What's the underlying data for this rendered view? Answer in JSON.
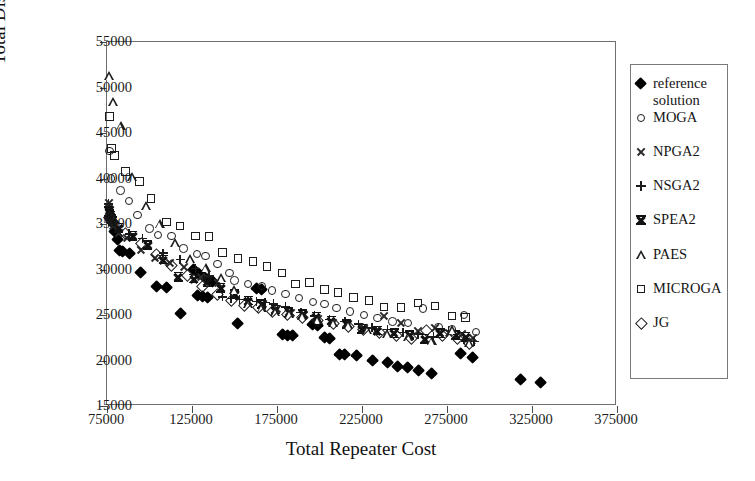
{
  "chart_data": {
    "type": "scatter",
    "title": "",
    "xlabel": "Total Repeater Cost",
    "ylabel": "Total Distance Cost",
    "xlim": [
      75000,
      375000
    ],
    "ylim": [
      15000,
      55000
    ],
    "xticks": [
      75000,
      125000,
      175000,
      225000,
      275000,
      325000,
      375000
    ],
    "yticks": [
      15000,
      20000,
      25000,
      30000,
      35000,
      40000,
      45000,
      50000,
      55000
    ],
    "xtick_labels": [
      "75000",
      "125000",
      "175000",
      "225000",
      "275000",
      "325000",
      "375000"
    ],
    "ytick_labels": [
      "15000",
      "20000",
      "25000",
      "30000",
      "35000",
      "40000",
      "45000",
      "50000",
      "55000"
    ],
    "grid": false,
    "legend_position": "right-outside",
    "series": [
      {
        "name": "reference solution",
        "marker": "filled-diamond",
        "color": "#000000",
        "points": [
          [
            76500,
            35700
          ],
          [
            77000,
            35500
          ],
          [
            77500,
            35300
          ],
          [
            78000,
            35100
          ],
          [
            79500,
            34200
          ],
          [
            81000,
            33300
          ],
          [
            82500,
            32100
          ],
          [
            84000,
            32000
          ],
          [
            88000,
            31700
          ],
          [
            95000,
            29700
          ],
          [
            104000,
            28100
          ],
          [
            110000,
            28000
          ],
          [
            118000,
            25200
          ],
          [
            126000,
            30000
          ],
          [
            129000,
            29500
          ],
          [
            131000,
            29300
          ],
          [
            134000,
            28900
          ],
          [
            137000,
            28700
          ],
          [
            128000,
            27100
          ],
          [
            131000,
            27000
          ],
          [
            134000,
            26900
          ],
          [
            152000,
            24100
          ],
          [
            163000,
            27900
          ],
          [
            166000,
            27800
          ],
          [
            178000,
            22800
          ],
          [
            181000,
            22700
          ],
          [
            184000,
            22700
          ],
          [
            196000,
            23900
          ],
          [
            199000,
            23800
          ],
          [
            203000,
            22500
          ],
          [
            206000,
            22400
          ],
          [
            212000,
            20700
          ],
          [
            215000,
            20600
          ],
          [
            222000,
            20500
          ],
          [
            231000,
            20000
          ],
          [
            240000,
            19800
          ],
          [
            246000,
            19300
          ],
          [
            252000,
            19200
          ],
          [
            258000,
            18900
          ],
          [
            266000,
            18600
          ],
          [
            283000,
            20800
          ],
          [
            290000,
            20300
          ],
          [
            318000,
            17900
          ],
          [
            330000,
            17600
          ]
        ]
      },
      {
        "name": "MOGA",
        "marker": "open-circle",
        "color": "#1c1c1c",
        "points": [
          [
            76500,
            43000
          ],
          [
            77500,
            40000
          ],
          [
            83000,
            38700
          ],
          [
            88000,
            37500
          ],
          [
            93000,
            36000
          ],
          [
            100000,
            34500
          ],
          [
            105000,
            33800
          ],
          [
            113000,
            33700
          ],
          [
            120000,
            32300
          ],
          [
            128000,
            31700
          ],
          [
            133000,
            31500
          ],
          [
            140000,
            30600
          ],
          [
            147000,
            29600
          ],
          [
            150000,
            28800
          ],
          [
            158000,
            28400
          ],
          [
            166000,
            28200
          ],
          [
            172000,
            27700
          ],
          [
            180000,
            27300
          ],
          [
            188000,
            26900
          ],
          [
            196000,
            26400
          ],
          [
            203000,
            26200
          ],
          [
            210000,
            25800
          ],
          [
            218000,
            25400
          ],
          [
            226000,
            25000
          ],
          [
            234000,
            24700
          ],
          [
            243000,
            24300
          ],
          [
            252000,
            24100
          ],
          [
            261000,
            25700
          ],
          [
            270000,
            23700
          ],
          [
            278000,
            23400
          ],
          [
            285000,
            25000
          ],
          [
            292000,
            23100
          ]
        ]
      },
      {
        "name": "NPGA2",
        "marker": "x",
        "color": "#2a2a2a",
        "points": [
          [
            76000,
            37300
          ],
          [
            76500,
            36600
          ],
          [
            77000,
            36000
          ],
          [
            77500,
            35600
          ],
          [
            78500,
            34800
          ],
          [
            82000,
            34000
          ],
          [
            87000,
            33500
          ],
          [
            95000,
            32200
          ],
          [
            103000,
            31300
          ],
          [
            112000,
            30700
          ],
          [
            120000,
            30300
          ],
          [
            130000,
            29200
          ],
          [
            140000,
            28500
          ],
          [
            150000,
            27200
          ],
          [
            158000,
            26500
          ],
          [
            167000,
            26200
          ],
          [
            175000,
            25700
          ],
          [
            183000,
            25200
          ],
          [
            191000,
            25000
          ],
          [
            199000,
            24600
          ],
          [
            208000,
            24200
          ],
          [
            217000,
            24000
          ],
          [
            226000,
            23600
          ],
          [
            238000,
            24900
          ],
          [
            248000,
            24200
          ],
          [
            258000,
            23300
          ],
          [
            268000,
            23600
          ],
          [
            276000,
            23100
          ],
          [
            284000,
            22900
          ],
          [
            290000,
            22500
          ]
        ]
      },
      {
        "name": "NSGA2",
        "marker": "plus",
        "color": "#1c1c1c",
        "points": [
          [
            76000,
            37200
          ],
          [
            76500,
            36800
          ],
          [
            77000,
            36400
          ],
          [
            77500,
            36000
          ],
          [
            78000,
            35700
          ],
          [
            79000,
            35300
          ],
          [
            88000,
            33900
          ],
          [
            96000,
            33400
          ],
          [
            108000,
            31800
          ],
          [
            118000,
            31100
          ],
          [
            127000,
            30100
          ],
          [
            135000,
            29300
          ],
          [
            143000,
            27000
          ],
          [
            148000,
            26800
          ],
          [
            153000,
            26700
          ],
          [
            158000,
            26600
          ],
          [
            163000,
            26500
          ],
          [
            168000,
            26400
          ],
          [
            173000,
            26200
          ],
          [
            180000,
            25900
          ],
          [
            189000,
            25300
          ],
          [
            197000,
            24900
          ],
          [
            206000,
            24500
          ],
          [
            215000,
            24300
          ],
          [
            223000,
            24000
          ],
          [
            231000,
            23600
          ],
          [
            240000,
            23400
          ],
          [
            249000,
            23100
          ],
          [
            258000,
            22900
          ],
          [
            267000,
            22600
          ],
          [
            276000,
            23300
          ],
          [
            285000,
            22300
          ],
          [
            291000,
            22100
          ]
        ]
      },
      {
        "name": "SPEA2",
        "marker": "bowtie",
        "color": "#111111",
        "points": [
          [
            76000,
            36400
          ],
          [
            76500,
            36100
          ],
          [
            77000,
            35700
          ],
          [
            78000,
            35300
          ],
          [
            82000,
            34600
          ],
          [
            90000,
            33700
          ],
          [
            99000,
            32700
          ],
          [
            108000,
            31100
          ],
          [
            117000,
            29200
          ],
          [
            126000,
            29000
          ],
          [
            134000,
            28600
          ],
          [
            142000,
            28000
          ],
          [
            150000,
            27300
          ],
          [
            158000,
            26600
          ],
          [
            166000,
            26200
          ],
          [
            174000,
            25600
          ],
          [
            182000,
            25300
          ],
          [
            190000,
            25100
          ],
          [
            198000,
            24800
          ],
          [
            207000,
            24400
          ],
          [
            216000,
            24000
          ],
          [
            225000,
            23500
          ],
          [
            234000,
            23300
          ],
          [
            244000,
            23000
          ],
          [
            253000,
            22800
          ],
          [
            262000,
            22400
          ],
          [
            271000,
            23000
          ],
          [
            280000,
            22800
          ],
          [
            286000,
            22600
          ]
        ]
      },
      {
        "name": "PAES",
        "marker": "open-triangle",
        "color": "#1c1c1c",
        "points": [
          [
            76500,
            51300
          ],
          [
            78500,
            48500
          ],
          [
            83000,
            45800
          ],
          [
            90000,
            40200
          ],
          [
            98000,
            37000
          ],
          [
            106000,
            35000
          ],
          [
            115000,
            33000
          ],
          [
            124000,
            31200
          ],
          [
            133000,
            30200
          ],
          [
            142000,
            29100
          ],
          [
            150000,
            27800
          ],
          [
            158000,
            26200
          ],
          [
            166000,
            25800
          ],
          [
            174000,
            25400
          ],
          [
            182000,
            25100
          ],
          [
            190000,
            24900
          ],
          [
            199000,
            24500
          ],
          [
            208000,
            24200
          ],
          [
            217000,
            23900
          ],
          [
            228000,
            23400
          ],
          [
            240000,
            23000
          ],
          [
            252000,
            22600
          ],
          [
            266000,
            22200
          ],
          [
            278000,
            23400
          ],
          [
            288000,
            22000
          ]
        ]
      },
      {
        "name": "MICROGA",
        "marker": "open-square",
        "color": "#1c1c1c",
        "points": [
          [
            76500,
            46800
          ],
          [
            77500,
            43300
          ],
          [
            79500,
            42500
          ],
          [
            86000,
            40800
          ],
          [
            94000,
            39700
          ],
          [
            101000,
            37800
          ],
          [
            110000,
            35200
          ],
          [
            118000,
            34800
          ],
          [
            127000,
            33700
          ],
          [
            135000,
            33600
          ],
          [
            143000,
            31900
          ],
          [
            152000,
            31200
          ],
          [
            161000,
            30900
          ],
          [
            169000,
            30300
          ],
          [
            178000,
            29600
          ],
          [
            186000,
            28400
          ],
          [
            194000,
            28600
          ],
          [
            203000,
            27800
          ],
          [
            211000,
            27500
          ],
          [
            220000,
            26900
          ],
          [
            229000,
            26600
          ],
          [
            238000,
            25900
          ],
          [
            248000,
            25800
          ],
          [
            258000,
            26300
          ],
          [
            268000,
            26000
          ],
          [
            278000,
            24900
          ],
          [
            286000,
            24700
          ]
        ]
      },
      {
        "name": "JG",
        "marker": "open-diamond",
        "color": "#1c1c1c",
        "points": [
          [
            76500,
            35700
          ],
          [
            77500,
            35400
          ],
          [
            79000,
            35200
          ],
          [
            86000,
            34000
          ],
          [
            95000,
            32900
          ],
          [
            104000,
            31700
          ],
          [
            113000,
            30400
          ],
          [
            122000,
            29300
          ],
          [
            131000,
            28100
          ],
          [
            140000,
            27300
          ],
          [
            148000,
            26600
          ],
          [
            156000,
            26100
          ],
          [
            164000,
            25800
          ],
          [
            172000,
            25400
          ],
          [
            181000,
            25100
          ],
          [
            190000,
            24700
          ],
          [
            199000,
            24400
          ],
          [
            208000,
            24100
          ],
          [
            217000,
            23700
          ],
          [
            226000,
            23400
          ],
          [
            235000,
            23100
          ],
          [
            245000,
            22800
          ],
          [
            254000,
            22400
          ],
          [
            263000,
            23300
          ],
          [
            272000,
            22800
          ],
          [
            281000,
            22400
          ],
          [
            288000,
            21900
          ]
        ]
      }
    ]
  },
  "legend": {
    "entries": [
      {
        "label": "reference",
        "label2": "solution",
        "marker": "filled-diamond"
      },
      {
        "label": "MOGA",
        "label2": "",
        "marker": "open-circle"
      },
      {
        "label": "NPGA2",
        "label2": "",
        "marker": "x"
      },
      {
        "label": "NSGA2",
        "label2": "",
        "marker": "plus"
      },
      {
        "label": "SPEA2",
        "label2": "",
        "marker": "bowtie"
      },
      {
        "label": "PAES",
        "label2": "",
        "marker": "open-triangle"
      },
      {
        "label": "MICROGA",
        "label2": "",
        "marker": "open-square"
      },
      {
        "label": "JG",
        "label2": "",
        "marker": "open-diamond"
      }
    ]
  }
}
